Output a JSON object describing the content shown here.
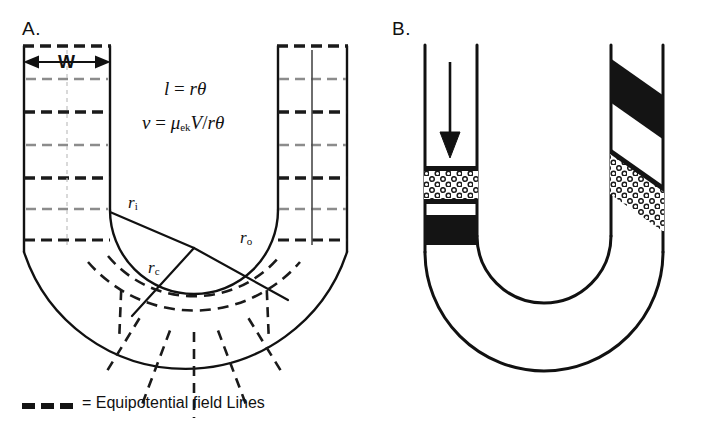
{
  "figure": {
    "panels": [
      {
        "id": "A",
        "label": "A.",
        "width_marker": "W",
        "equations": {
          "eq1_lhs": "l",
          "eq1_eq": "=",
          "eq1_rhs": "rθ",
          "eq2_lhs": "ν",
          "eq2_eq": "=",
          "eq2_mu": "μ",
          "eq2_mu_sub": "ek",
          "eq2_V": "V",
          "eq2_slash": "/",
          "eq2_rtheta": "rθ"
        },
        "radii": [
          {
            "name": "r-inner",
            "symbol": "r",
            "subscript": "i"
          },
          {
            "name": "r-center",
            "symbol": "r",
            "subscript": "c"
          },
          {
            "name": "r-outer",
            "symbol": "r",
            "subscript": "o"
          }
        ]
      },
      {
        "id": "B",
        "label": "B.",
        "flow_arrow": "down-arrow",
        "bands": [
          {
            "name": "stippled-band-inlet",
            "style": "stippled",
            "orientation": "horizontal"
          },
          {
            "name": "black-band-inlet",
            "style": "solid-black",
            "orientation": "horizontal"
          },
          {
            "name": "black-band-outlet",
            "style": "solid-black",
            "orientation": "skewed"
          },
          {
            "name": "stippled-band-outlet",
            "style": "stippled",
            "orientation": "skewed"
          }
        ]
      }
    ],
    "legend": {
      "swatch": "thick-dashed-line",
      "text": "= Equipotential field Lines"
    },
    "colors": {
      "stroke": "#111111",
      "equipotential_heavy": "#1a1a1a",
      "equipotential_light": "#8c8c8c",
      "band_black": "#141414",
      "background": "#ffffff"
    }
  }
}
